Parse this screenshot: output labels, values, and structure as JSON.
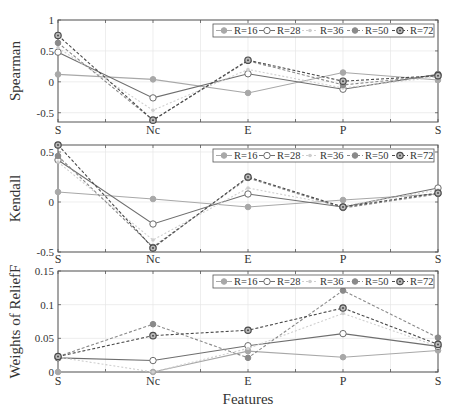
{
  "chart_data": [
    {
      "type": "line",
      "title": "",
      "xlabel": "",
      "ylabel": "Spearman",
      "categories": [
        "S",
        "Nc",
        "E",
        "P",
        "S"
      ],
      "ylim": [
        -0.65,
        1.0
      ],
      "yticks": [
        1,
        0.5,
        0,
        -0.5
      ],
      "ytick_labels": [
        "1",
        "0.5",
        "0",
        "-0.5"
      ],
      "grid": true,
      "legend_position": "top-right",
      "series": [
        {
          "name": "R=16",
          "values": [
            0.12,
            0.04,
            -0.18,
            0.15,
            0.03
          ]
        },
        {
          "name": "R=28",
          "values": [
            0.48,
            -0.26,
            0.13,
            -0.12,
            0.12
          ]
        },
        {
          "name": "R=36",
          "values": [
            0.55,
            -0.46,
            0.2,
            -0.1,
            0.08
          ]
        },
        {
          "name": "R=50",
          "values": [
            0.63,
            -0.62,
            0.34,
            -0.05,
            0.1
          ]
        },
        {
          "name": "R=72",
          "values": [
            0.75,
            -0.62,
            0.35,
            0.01,
            0.1
          ]
        }
      ]
    },
    {
      "type": "line",
      "title": "",
      "xlabel": "",
      "ylabel": "Kendall",
      "categories": [
        "S",
        "Nc",
        "E",
        "P",
        "S"
      ],
      "ylim": [
        -0.5,
        0.57
      ],
      "yticks": [
        0.5,
        0,
        -0.5
      ],
      "ytick_labels": [
        "0.5",
        "0",
        "-0.5"
      ],
      "grid": true,
      "legend_position": "top-right",
      "series": [
        {
          "name": "R=16",
          "values": [
            0.1,
            0.03,
            -0.05,
            0.02,
            0.08
          ]
        },
        {
          "name": "R=28",
          "values": [
            0.42,
            -0.22,
            0.08,
            -0.05,
            0.14
          ]
        },
        {
          "name": "R=36",
          "values": [
            0.4,
            -0.38,
            0.14,
            -0.04,
            0.12
          ]
        },
        {
          "name": "R=50",
          "values": [
            0.46,
            -0.45,
            0.24,
            -0.06,
            0.08
          ]
        },
        {
          "name": "R=72",
          "values": [
            0.57,
            -0.46,
            0.25,
            -0.05,
            0.09
          ]
        }
      ]
    },
    {
      "type": "line",
      "title": "",
      "xlabel": "Features",
      "ylabel": "Weights of ReliefF",
      "categories": [
        "S",
        "Nc",
        "E",
        "P",
        "S"
      ],
      "ylim": [
        0,
        0.15
      ],
      "yticks": [
        0.15,
        0.1,
        0.05,
        0
      ],
      "ytick_labels": [
        "0.15",
        "0.1",
        "0.05",
        "0"
      ],
      "grid": true,
      "legend_position": "top-right",
      "series": [
        {
          "name": "R=16",
          "values": [
            0.0,
            0.0,
            0.031,
            0.022,
            0.032
          ]
        },
        {
          "name": "R=28",
          "values": [
            0.021,
            0.017,
            0.039,
            0.057,
            0.038
          ]
        },
        {
          "name": "R=36",
          "values": [
            0.022,
            0.0,
            0.035,
            0.087,
            0.038
          ]
        },
        {
          "name": "R=50",
          "values": [
            0.023,
            0.071,
            0.021,
            0.121,
            0.051
          ]
        },
        {
          "name": "R=72",
          "values": [
            0.023,
            0.054,
            0.062,
            0.095,
            0.041
          ]
        }
      ]
    }
  ],
  "legend": {
    "entries": [
      "R=16",
      "R=28",
      "R=36",
      "R=50",
      "R=72"
    ]
  },
  "series_styles": {
    "R=16": {
      "color": "#a8a8a8",
      "dash": "",
      "marker": "filled-circle"
    },
    "R=28": {
      "color": "#6e6e6e",
      "dash": "",
      "marker": "open-circle"
    },
    "R=36": {
      "color": "#cfcfcf",
      "dash": "2,2",
      "marker": "point"
    },
    "R=50": {
      "color": "#8a8a8a",
      "dash": "3,2",
      "marker": "filled-circle"
    },
    "R=72": {
      "color": "#4a4a4a",
      "dash": "3,2",
      "marker": "dot-circle"
    }
  },
  "axis_color": "#555555",
  "grid_color": "#e6e6e6"
}
